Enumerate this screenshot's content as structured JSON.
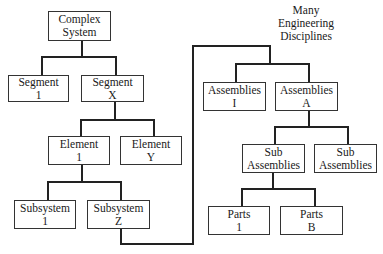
{
  "diagram": {
    "type": "hierarchy-tree",
    "left_tree": {
      "root": {
        "line1": "Complex",
        "line2": "System"
      },
      "segments": [
        {
          "line1": "Segment",
          "line2": "1"
        },
        {
          "line1": "Segment",
          "line2": "X"
        }
      ],
      "elements": [
        {
          "line1": "Element",
          "line2": "1"
        },
        {
          "line1": "Element",
          "line2": "Y"
        }
      ],
      "subsystems": [
        {
          "line1": "Subsystem",
          "line2": "1"
        },
        {
          "line1": "Subsystem",
          "line2": "Z"
        }
      ]
    },
    "right_tree": {
      "label": {
        "line1": "Many",
        "line2": "Engineering",
        "line3": "Disciplines"
      },
      "assemblies": [
        {
          "line1": "Assemblies",
          "line2": "I"
        },
        {
          "line1": "Assemblies",
          "line2": "A"
        }
      ],
      "sub_assemblies": [
        {
          "line1": "Sub",
          "line2": "Assemblies"
        },
        {
          "line1": "Sub",
          "line2": "Assemblies"
        }
      ],
      "parts": [
        {
          "line1": "Parts",
          "line2": "1"
        },
        {
          "line1": "Parts",
          "line2": "B"
        }
      ]
    }
  }
}
